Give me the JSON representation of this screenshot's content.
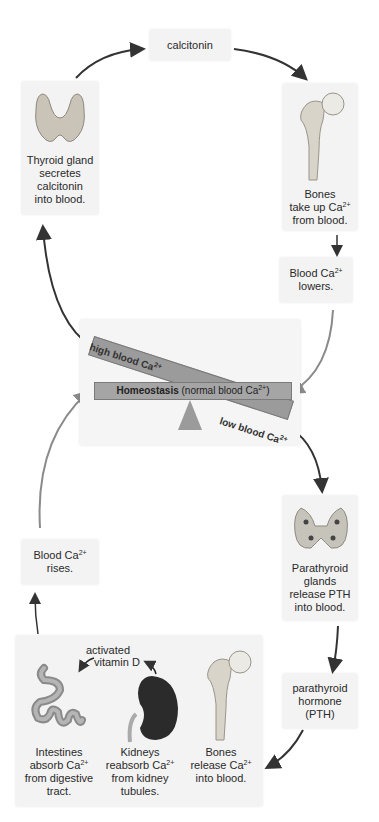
{
  "diagram": {
    "colors": {
      "box_bg": "#f3f3f3",
      "bar": "#9b9b9b",
      "arrow_dark": "#333333",
      "arrow_light": "#8a8a8a",
      "gland": "#c9c3b8",
      "kidney": "#2b2b2b"
    },
    "calcitonin_box": {
      "label": "calcitonin"
    },
    "thyroid_box": {
      "line1": "Thyroid gland",
      "line2": "secretes",
      "line3": "calcitonin",
      "line4": "into blood."
    },
    "bones_up_box": {
      "line1": "Bones",
      "line2": "take up Ca",
      "sup": "2+",
      "line3": "from blood."
    },
    "lowers_box": {
      "line1": "Blood Ca",
      "sup": "2+",
      "line2": "lowers."
    },
    "homeostasis": {
      "bold": "Homeostasis",
      "rest": " (normal blood Ca",
      "sup": "2+",
      "close": ")",
      "high_label": "high blood Ca",
      "high_sup": "2+",
      "low_label": "low blood Ca",
      "low_sup": "2+"
    },
    "parathyroid_box": {
      "line1": "Parathyroid",
      "line2": "glands",
      "line3": "release PTH",
      "line4": "into blood."
    },
    "pth_box": {
      "line1": "parathyroid",
      "line2": "hormone",
      "line3": "(PTH)"
    },
    "rises_box": {
      "line1": "Blood Ca",
      "sup": "2+",
      "line2": "rises."
    },
    "bottom_box": {
      "vitamin_line1": "activated",
      "vitamin_line2": "vitamin D",
      "intestines": {
        "line1": "Intestines",
        "line2": "absorb Ca",
        "sup": "2+",
        "line3": "from digestive",
        "line4": "tract."
      },
      "kidneys": {
        "line1": "Kidneys",
        "line2": "reabsorb Ca",
        "sup": "2+",
        "line3": "from kidney",
        "line4": "tubules."
      },
      "bones": {
        "line1": "Bones",
        "line2": "release Ca",
        "sup": "2+",
        "line3": "into blood."
      }
    }
  }
}
